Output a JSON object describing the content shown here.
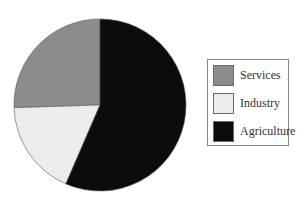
{
  "chart_data": {
    "type": "pie",
    "title": "",
    "categories": [
      "Services",
      "Industry",
      "Agriculture"
    ],
    "values": [
      25.5,
      18,
      56.5
    ],
    "unit": "%",
    "colors": [
      "#8c8c8c",
      "#ececec",
      "#0c0c0c"
    ],
    "start_angle_deg": 0,
    "direction": "counterclockwise",
    "legend_position": "right",
    "legend": [
      {
        "label": "Services",
        "color": "#8c8c8c"
      },
      {
        "label": "Industry",
        "color": "#ececec"
      },
      {
        "label": "Agriculture",
        "color": "#0c0c0c"
      }
    ]
  }
}
